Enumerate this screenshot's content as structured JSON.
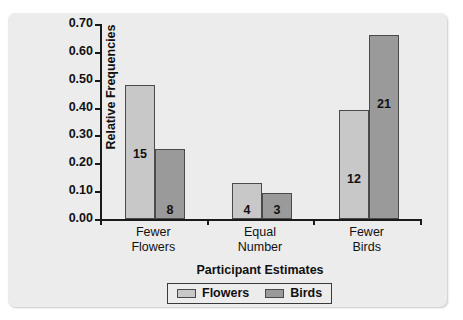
{
  "chart_data": {
    "type": "bar",
    "title": "",
    "xlabel": "Participant Estimates",
    "ylabel": "Relative Frequencies",
    "categories": [
      "Fewer Flowers",
      "Equal Number",
      "Fewer Birds"
    ],
    "category_lines": [
      [
        "Fewer",
        "Flowers"
      ],
      [
        "Equal",
        "Number"
      ],
      [
        "Fewer",
        "Birds"
      ]
    ],
    "series": [
      {
        "name": "Flowers",
        "color": "#c8c8c8",
        "values": [
          0.48,
          0.13,
          0.39
        ],
        "labels": [
          "15",
          "4",
          "12"
        ]
      },
      {
        "name": "Birds",
        "color": "#9a9a9a",
        "values": [
          0.25,
          0.095,
          0.66
        ],
        "labels": [
          "8",
          "3",
          "21"
        ]
      }
    ],
    "ylim": [
      0.0,
      0.7
    ],
    "ytick_labels": [
      "0.70",
      "0.60",
      "0.50",
      "0.40",
      "0.30",
      "0.20",
      "0.10",
      "0.00"
    ],
    "ytick_values": [
      0.7,
      0.6,
      0.5,
      0.4,
      0.3,
      0.2,
      0.1,
      0.0
    ],
    "grid": false,
    "legend_position": "bottom-center",
    "legend_entries": [
      "Flowers",
      "Birds"
    ]
  }
}
